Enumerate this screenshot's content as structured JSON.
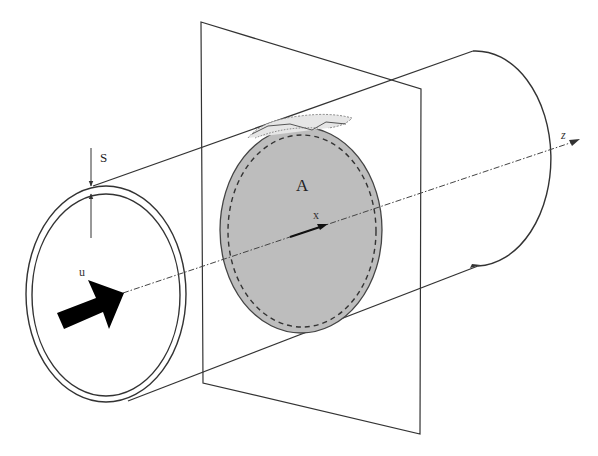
{
  "diagram": {
    "labels": {
      "wall_thickness": "S",
      "velocity": "u",
      "area": "A",
      "local_axis": "x",
      "main_axis": "z"
    },
    "colors": {
      "line": "#333333",
      "section_fill": "#bdbdbd",
      "arrow_fill": "#000000",
      "background": "#ffffff"
    }
  }
}
